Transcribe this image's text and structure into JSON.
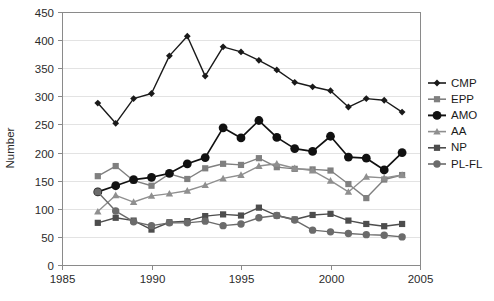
{
  "chart_data": {
    "type": "line",
    "title": "",
    "xlabel": "",
    "ylabel": "Number",
    "xlim": [
      1985,
      2005
    ],
    "ylim": [
      0,
      450
    ],
    "x_ticks": [
      1985,
      1990,
      1995,
      2000,
      2005
    ],
    "y_ticks": [
      0,
      50,
      100,
      150,
      200,
      250,
      300,
      350,
      400,
      450
    ],
    "grid": "horizontal",
    "legend_position": "right",
    "x": [
      1987,
      1988,
      1989,
      1990,
      1991,
      1992,
      1993,
      1994,
      1995,
      1996,
      1997,
      1998,
      1999,
      2000,
      2001,
      2002,
      2003,
      2004
    ],
    "series": [
      {
        "name": "CMP",
        "color": "#1a1a1a",
        "marker": "diamond",
        "values": [
          288,
          252,
          296,
          305,
          372,
          407,
          336,
          388,
          379,
          364,
          347,
          325,
          317,
          310,
          281,
          296,
          293,
          272
        ]
      },
      {
        "name": "EPP",
        "color": "#808080",
        "marker": "square",
        "values": [
          158,
          176,
          150,
          141,
          162,
          153,
          172,
          180,
          178,
          190,
          174,
          171,
          170,
          168,
          144,
          119,
          152,
          160
        ]
      },
      {
        "name": "AMO",
        "color": "#111111",
        "marker": "circle",
        "values": [
          130,
          141,
          152,
          156,
          163,
          180,
          191,
          244,
          226,
          257,
          227,
          207,
          202,
          229,
          192,
          190,
          169,
          200
        ]
      },
      {
        "name": "AA",
        "color": "#8f8f8f",
        "marker": "triangle",
        "values": [
          95,
          124,
          112,
          123,
          127,
          132,
          142,
          154,
          160,
          176,
          180,
          172,
          168,
          150,
          130,
          157,
          155,
          160
        ]
      },
      {
        "name": "NP",
        "color": "#4d4d4d",
        "marker": "square",
        "values": [
          75,
          84,
          79,
          63,
          76,
          78,
          87,
          90,
          88,
          102,
          88,
          81,
          89,
          91,
          79,
          73,
          69,
          73
        ]
      },
      {
        "name": "PL-FL",
        "color": "#6b6b6b",
        "marker": "circle",
        "values": [
          130,
          96,
          77,
          70,
          75,
          75,
          78,
          70,
          73,
          84,
          88,
          80,
          62,
          59,
          56,
          54,
          53,
          50
        ]
      }
    ]
  },
  "axis": {
    "y_title": "Number",
    "y_tick_labels": [
      "0",
      "50",
      "100",
      "150",
      "200",
      "250",
      "300",
      "350",
      "400",
      "450"
    ],
    "x_tick_labels": [
      "1985",
      "1990",
      "1995",
      "2000",
      "2005"
    ]
  },
  "legend": {
    "entries": [
      {
        "label": "CMP"
      },
      {
        "label": "EPP"
      },
      {
        "label": "AMO"
      },
      {
        "label": "AA"
      },
      {
        "label": "NP"
      },
      {
        "label": "PL-FL"
      }
    ]
  }
}
